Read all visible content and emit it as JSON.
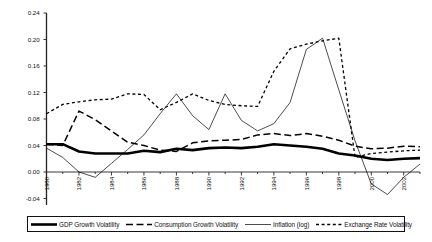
{
  "chart_data": {
    "type": "line",
    "title": "",
    "xlabel": "",
    "ylabel": "",
    "ylim": [
      -0.04,
      0.24
    ],
    "ytick_values": [
      -0.04,
      0.0,
      0.04,
      0.08,
      0.12,
      0.16,
      0.2,
      0.24
    ],
    "ytick_labels": [
      "-0.04",
      "0.00",
      "0.04",
      "0.08",
      "0.12",
      "0.16",
      "0.20",
      "0.24"
    ],
    "xlim": [
      1980,
      2003
    ],
    "x": [
      1980,
      1981,
      1982,
      1983,
      1984,
      1985,
      1986,
      1987,
      1988,
      1989,
      1990,
      1991,
      1992,
      1993,
      1994,
      1995,
      1996,
      1997,
      1998,
      1999,
      2000,
      2001,
      2002,
      2003
    ],
    "xtick_labels": [
      "1980",
      "1982",
      "1984",
      "1986",
      "1988",
      "1990",
      "1992",
      "1994",
      "1996",
      "1998",
      "2000",
      "2002"
    ],
    "xtick_values": [
      1980,
      1982,
      1984,
      1986,
      1988,
      1990,
      1992,
      1994,
      1996,
      1998,
      2000,
      2002
    ],
    "grid": false,
    "legend_position": "bottom",
    "series": [
      {
        "name": "GDP Growth Volatility",
        "style": "solid-thick",
        "color": "#000000",
        "values": [
          0.042,
          0.042,
          0.031,
          0.028,
          0.028,
          0.028,
          0.032,
          0.03,
          0.035,
          0.033,
          0.036,
          0.037,
          0.036,
          0.038,
          0.042,
          0.04,
          0.038,
          0.035,
          0.028,
          0.025,
          0.02,
          0.018,
          0.02,
          0.021
        ]
      },
      {
        "name": "Consumption Growth Volatility",
        "style": "dashed-medium",
        "color": "#000000",
        "values": [
          0.042,
          0.04,
          0.092,
          0.079,
          0.062,
          0.045,
          0.04,
          0.033,
          0.031,
          0.044,
          0.047,
          0.048,
          0.049,
          0.056,
          0.058,
          0.055,
          0.058,
          0.054,
          0.048,
          0.039,
          0.035,
          0.036,
          0.039,
          0.038
        ]
      },
      {
        "name": "Inflation (log)",
        "style": "solid-thin",
        "color": "#000000",
        "values": [
          0.036,
          0.022,
          0.0,
          -0.008,
          0.013,
          0.034,
          0.056,
          0.088,
          0.118,
          0.085,
          0.064,
          0.118,
          0.078,
          0.062,
          0.073,
          0.105,
          0.185,
          0.202,
          0.124,
          0.047,
          -0.018,
          -0.034,
          -0.008,
          0.012
        ]
      },
      {
        "name": "Exchange Rate Volatility",
        "style": "dashed-fine",
        "color": "#000000",
        "values": [
          0.088,
          0.102,
          0.106,
          0.109,
          0.11,
          0.118,
          0.117,
          0.094,
          0.105,
          0.118,
          0.108,
          0.102,
          0.1,
          0.099,
          0.152,
          0.186,
          0.193,
          0.198,
          0.202,
          0.022,
          0.028,
          0.03,
          0.032,
          0.033
        ]
      }
    ]
  },
  "legend": {
    "items": [
      {
        "label": "GDP Growth Volatility",
        "style": "solid-thick"
      },
      {
        "label": "Consumption Growth Volatility",
        "style": "dashed-medium"
      },
      {
        "label": "Inflation (log)",
        "style": "solid-thin"
      },
      {
        "label": "Exchange Rate Volatility",
        "style": "dashed-fine"
      }
    ]
  }
}
